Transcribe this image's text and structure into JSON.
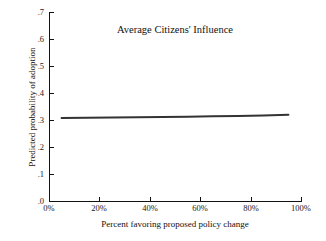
{
  "chart_data": {
    "type": "line",
    "title": "Average Citizens' Influence",
    "xlabel": "Percent favoring proposed policy change",
    "ylabel": "Predicted probability of adoption",
    "xlim": [
      0,
      100
    ],
    "ylim": [
      0.0,
      0.7
    ],
    "grid": false,
    "legend": null,
    "xtick_labels": [
      "0%",
      "20%",
      "40%",
      "60%",
      "80%",
      "100%"
    ],
    "xtick_values": [
      0,
      20,
      40,
      60,
      80,
      100
    ],
    "ytick_labels": [
      ".0",
      ".1",
      ".2",
      ".3",
      ".4",
      ".5",
      ".6",
      ".7"
    ],
    "ytick_values": [
      0.0,
      0.1,
      0.2,
      0.3,
      0.4,
      0.5,
      0.6,
      0.7
    ],
    "series": [
      {
        "name": "Average Citizens' Influence",
        "color": "#333333",
        "line_width": 2,
        "x": [
          5,
          15,
          25,
          35,
          45,
          55,
          65,
          75,
          85,
          95
        ],
        "values": [
          0.307,
          0.308,
          0.309,
          0.31,
          0.311,
          0.312,
          0.314,
          0.315,
          0.317,
          0.319
        ]
      }
    ]
  },
  "figure": {
    "background_color": "#ffffff",
    "axis_color": "#111111",
    "text_color": "#1a1a1a"
  }
}
